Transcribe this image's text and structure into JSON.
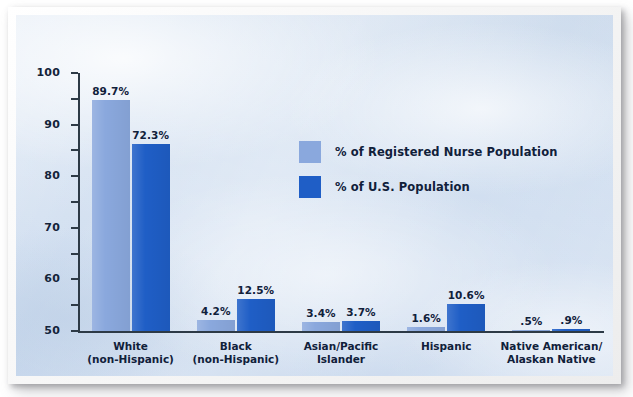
{
  "chart_data": {
    "type": "bar",
    "title": "",
    "xlabel": "",
    "ylabel": "",
    "ylim": [
      0,
      100
    ],
    "yticks": [
      0,
      10,
      20,
      30,
      40,
      50,
      60,
      70,
      80,
      90,
      100
    ],
    "grid": false,
    "legend_position": "inside-upper-center",
    "categories": [
      "White\n(non-Hispanic)",
      "Black\n(non-Hispanic)",
      "Asian/Pacific\nIslander",
      "Hispanic",
      "Native American/\nAlaskan Native"
    ],
    "category_lines": [
      [
        "White",
        "(non-Hispanic)"
      ],
      [
        "Black",
        "(non-Hispanic)"
      ],
      [
        "Asian/Pacific",
        "Islander"
      ],
      [
        "Hispanic",
        ""
      ],
      [
        "Native American/",
        "Alaskan Native"
      ]
    ],
    "series": [
      {
        "name": "% of Registered Nurse Population",
        "color": "#8aa8dd",
        "values": [
          89.7,
          4.2,
          3.4,
          1.6,
          0.5
        ],
        "labels": [
          "89.7%",
          "4.2%",
          "3.4%",
          "1.6%",
          ".5%"
        ]
      },
      {
        "name": "% of U.S. Population",
        "color": "#1f5ec6",
        "values": [
          72.3,
          12.5,
          3.7,
          10.6,
          0.9
        ],
        "labels": [
          "72.3%",
          "12.5%",
          "3.7%",
          "10.6%",
          ".9%"
        ]
      }
    ]
  },
  "colors": {
    "series_light": "#8aa8dd",
    "series_dark": "#1f5ec6",
    "axis": "#2d3a46",
    "text": "#10203a",
    "background": "#d3e0f0",
    "frame": "#f2f2f2"
  }
}
